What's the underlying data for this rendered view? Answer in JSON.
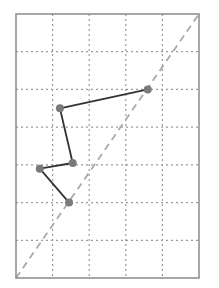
{
  "chart_data": {
    "type": "line",
    "title": "",
    "xlabel": "",
    "ylabel": "",
    "xlim": [
      0,
      5
    ],
    "ylim": [
      0,
      7
    ],
    "grid": true,
    "grid_style": "dotted",
    "legend": null,
    "x_ticks": [
      0,
      1,
      2,
      3,
      4,
      5
    ],
    "y_ticks": [
      0,
      1,
      2,
      3,
      4,
      5,
      6,
      7
    ],
    "series": [
      {
        "name": "path",
        "type": "line-with-markers",
        "color": "#333333",
        "marker_color": "#7a7a7a",
        "points": [
          {
            "x": 3.6,
            "y": 5.0
          },
          {
            "x": 1.2,
            "y": 4.5
          },
          {
            "x": 1.55,
            "y": 3.05
          },
          {
            "x": 0.65,
            "y": 2.9
          },
          {
            "x": 1.45,
            "y": 2.0
          }
        ]
      },
      {
        "name": "diagonal",
        "type": "dashed-line",
        "color": "#aaaaaa",
        "points": [
          {
            "x": 0,
            "y": 0
          },
          {
            "x": 5,
            "y": 7
          }
        ]
      }
    ]
  },
  "frame": {
    "left": 16,
    "top": 14,
    "width": 183,
    "height": 264,
    "border_color": "#8a8a8a",
    "grid_color": "#9a9a9a"
  }
}
